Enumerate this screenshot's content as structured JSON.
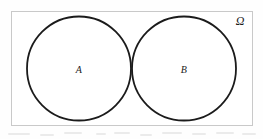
{
  "figure": {
    "kind": "venn-diagram",
    "canvas": {
      "width": 263,
      "height": 139,
      "background": "#fefefe"
    }
  },
  "universe": {
    "label": "Ω",
    "label_name": "omega",
    "border_color": "#c9c9c9",
    "fill_color": "#ffffff",
    "rect": {
      "x": 11,
      "y": 11,
      "width": 242,
      "height": 115
    },
    "label_position": {
      "x": 240,
      "y": 21
    }
  },
  "sets": [
    {
      "label": "A",
      "name": "set-a",
      "center": {
        "x": 79,
        "y": 68.5
      },
      "radius": 52,
      "stroke_color": "#1b1b1b",
      "stroke_width": 1.8,
      "fill": "none",
      "label_position": {
        "x": 79,
        "y": 70
      }
    },
    {
      "label": "B",
      "name": "set-b",
      "center": {
        "x": 184,
        "y": 68.5
      },
      "radius": 52,
      "stroke_color": "#1b1b1b",
      "stroke_width": 1.8,
      "fill": "none",
      "label_position": {
        "x": 184,
        "y": 70
      }
    }
  ],
  "relationship": {
    "type": "disjoint",
    "intersection_shown": false
  },
  "artifacts": {
    "scan_smudges": [
      {
        "x": 8,
        "y": 4,
        "width": 22
      },
      {
        "x": 40,
        "y": 5,
        "width": 14
      },
      {
        "x": 64,
        "y": 3,
        "width": 18
      },
      {
        "x": 96,
        "y": 4,
        "width": 10
      },
      {
        "x": 114,
        "y": 3,
        "width": 16
      },
      {
        "x": 140,
        "y": 5,
        "width": 12
      },
      {
        "x": 162,
        "y": 3,
        "width": 20
      },
      {
        "x": 192,
        "y": 4,
        "width": 14
      },
      {
        "x": 216,
        "y": 3,
        "width": 18
      },
      {
        "x": 242,
        "y": 4,
        "width": 14
      }
    ]
  }
}
